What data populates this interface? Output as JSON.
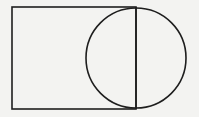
{
  "figure": {
    "background_color": "#f3f3f1",
    "stroke_color": "#1e1e1e",
    "stroke_width": 1.6,
    "rectangle": {
      "x": 12,
      "y": 7,
      "width": 124,
      "height": 102
    },
    "circle": {
      "cx": 136,
      "cy": 58,
      "r": 50
    },
    "diameter_line": {
      "x1": 136,
      "y1": 7,
      "x2": 136,
      "y2": 109
    }
  }
}
